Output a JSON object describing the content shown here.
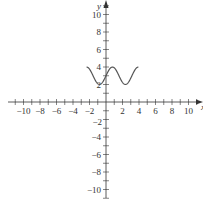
{
  "chart_data": {
    "type": "line",
    "title": "",
    "xlabel": "x",
    "ylabel": "y",
    "xlim": [
      -11,
      11
    ],
    "ylim": [
      -11,
      11
    ],
    "grid": false,
    "legend": null,
    "x_ticks": [
      -10,
      -8,
      -6,
      -4,
      -2,
      2,
      4,
      6,
      8,
      10
    ],
    "y_ticks": [
      -10,
      -8,
      -6,
      -4,
      -2,
      2,
      4,
      6,
      8,
      10
    ],
    "minor_tick_step": 1,
    "series": [
      {
        "name": "y = 3 + sin(2x)",
        "function": "3 + sin(2x)",
        "domain": [
          -2.356,
          3.927
        ],
        "x": [
          -2.356,
          -1.963,
          -1.571,
          -1.178,
          -0.785,
          -0.393,
          0,
          0.393,
          0.785,
          1.178,
          1.571,
          1.963,
          2.356,
          2.749,
          3.142,
          3.534,
          3.927
        ],
        "values": [
          4,
          3.707,
          3,
          2.293,
          2,
          2.293,
          3,
          3.707,
          4,
          3.707,
          3,
          2.293,
          2,
          2.293,
          3,
          3.707,
          4
        ],
        "color": "#555555"
      }
    ]
  },
  "labels": {
    "x_axis": "x",
    "y_axis": "y",
    "x_tick_labels": [
      "−10",
      "−8",
      "−6",
      "−4",
      "−2",
      "2",
      "4",
      "6",
      "8",
      "10"
    ],
    "y_tick_labels": [
      "10",
      "8",
      "6",
      "4",
      "2",
      "−2",
      "−4",
      "−6",
      "−8",
      "−10"
    ]
  },
  "colors": {
    "axis": "#333333",
    "curve": "#555555",
    "background": "#ffffff"
  }
}
